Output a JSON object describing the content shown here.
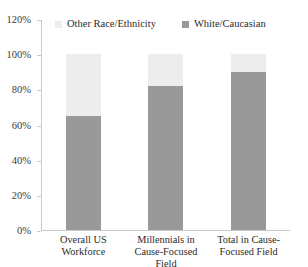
{
  "chart_data": {
    "type": "bar",
    "subtype": "stacked-bar-100",
    "title": "",
    "xlabel": "",
    "ylabel": "",
    "ylim": [
      0,
      120
    ],
    "ytick_labels": [
      "0%",
      "20%",
      "40%",
      "60%",
      "80%",
      "100%",
      "120%"
    ],
    "ytick_values": [
      0,
      20,
      40,
      60,
      80,
      100,
      120
    ],
    "grid": false,
    "legend_position": "top",
    "categories": [
      "Overall US Workforce",
      "Millennials in Cause-Focused Field",
      "Total in Cause-Focused Field"
    ],
    "series": [
      {
        "name": "White/Caucasian",
        "color": "#999999",
        "values": [
          65,
          82,
          90
        ]
      },
      {
        "name": "Other Race/Ethnicity",
        "color": "#ededed",
        "values": [
          35,
          18,
          10
        ]
      }
    ]
  },
  "legend": {
    "entries": [
      {
        "label": "Other Race/Ethnicity",
        "color": "#ededed"
      },
      {
        "label": "White/Caucasian",
        "color": "#989898"
      }
    ]
  },
  "axis": {
    "y_labels": [
      "120%",
      "100%",
      "80%",
      "60%",
      "40%",
      "20%",
      "0%"
    ]
  },
  "xaxis": {
    "labels": [
      "Overall US Workforce",
      "Millennials in Cause-Focused Field",
      "Total in Cause-Focused Field"
    ]
  },
  "colors": {
    "white_caucasian": "#999999",
    "other_race": "#ededed",
    "axis": "#c9c9c9",
    "text": "#2b2b2b"
  }
}
